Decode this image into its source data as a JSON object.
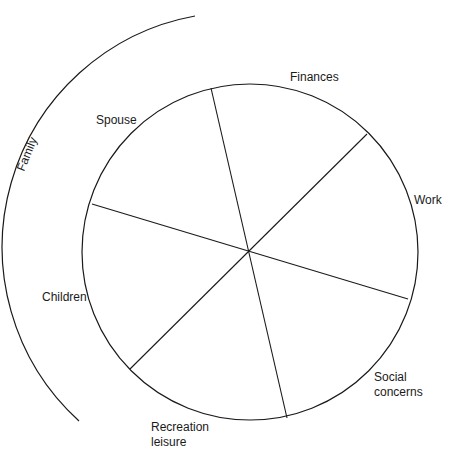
{
  "diagram": {
    "type": "wheel",
    "center": {
      "x": 250,
      "y": 252
    },
    "radius": 168,
    "stroke_color": "#1a1a1a",
    "background": "#ffffff",
    "spokes": [
      {
        "x1": 211,
        "y1": 88,
        "x2": 287,
        "y2": 418
      },
      {
        "x1": 367,
        "y1": 134,
        "x2": 130,
        "y2": 369
      },
      {
        "x1": 92,
        "y1": 204,
        "x2": 408,
        "y2": 299
      }
    ],
    "outer_arc": {
      "start": {
        "x": 195,
        "y": 16
      },
      "end": {
        "x": 79,
        "y": 421
      },
      "radius": 235,
      "label": "Family"
    },
    "segments": [
      {
        "label": "Spouse"
      },
      {
        "label": "Finances"
      },
      {
        "label": "Work"
      },
      {
        "label": "Social",
        "label_line2": "concerns"
      },
      {
        "label": "Recreation",
        "label_line2": "leisure"
      },
      {
        "label": "Children"
      }
    ]
  }
}
